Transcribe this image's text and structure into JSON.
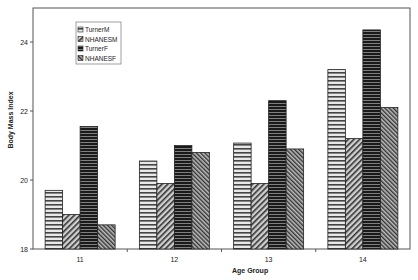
{
  "chart_data": {
    "type": "bar",
    "title": "",
    "xlabel": "Age Group",
    "ylabel": "Body Mass Index",
    "categories": [
      "11",
      "12",
      "13",
      "14"
    ],
    "series": [
      {
        "name": "TurnerM",
        "values": [
          19.7,
          20.55,
          21.07,
          23.2
        ],
        "pattern": "horizontal-lines-light"
      },
      {
        "name": "NHANESM",
        "values": [
          19.0,
          19.9,
          19.9,
          21.2
        ],
        "pattern": "diagonal-hatch"
      },
      {
        "name": "TurnerF",
        "values": [
          21.55,
          21.0,
          22.3,
          24.35
        ],
        "pattern": "horizontal-lines-dark"
      },
      {
        "name": "NHANESF",
        "values": [
          18.7,
          20.8,
          20.9,
          22.1
        ],
        "pattern": "dense-diagonal-hatch"
      }
    ],
    "ylim": [
      18,
      24.8
    ],
    "yticks": [
      "18",
      "20",
      "22",
      "24"
    ],
    "grid": false,
    "legend_position": "upper-left inside"
  }
}
